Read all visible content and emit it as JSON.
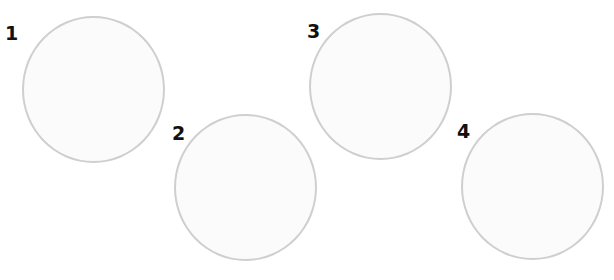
{
  "items": [
    {
      "label": "1"
    },
    {
      "label": "2"
    },
    {
      "label": "3"
    },
    {
      "label": "4"
    }
  ],
  "colors": {
    "circle_border": "#cfcfcf",
    "circle_fill": "#fbfbfb",
    "label": "#111111"
  }
}
